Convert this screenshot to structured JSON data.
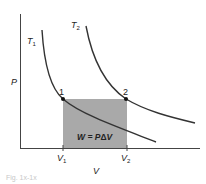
{
  "diagram": {
    "axes": {
      "y_label": "P",
      "x_label": "V",
      "x_ticks": [
        {
          "main": "V",
          "sub": "1"
        },
        {
          "main": "V",
          "sub": "2"
        }
      ]
    },
    "curves": [
      {
        "main": "T",
        "sub": "1"
      },
      {
        "main": "T",
        "sub": "2"
      }
    ],
    "points": [
      {
        "label": "1"
      },
      {
        "label": "2"
      }
    ],
    "work_area": {
      "label_pre": "W = P",
      "label_delta": "Δ",
      "label_post": "V",
      "fill": "#a9a9a9"
    },
    "colors": {
      "line": "#333333",
      "fill": "#a9a9a9"
    },
    "caption": "Fig. 1x-1x"
  }
}
